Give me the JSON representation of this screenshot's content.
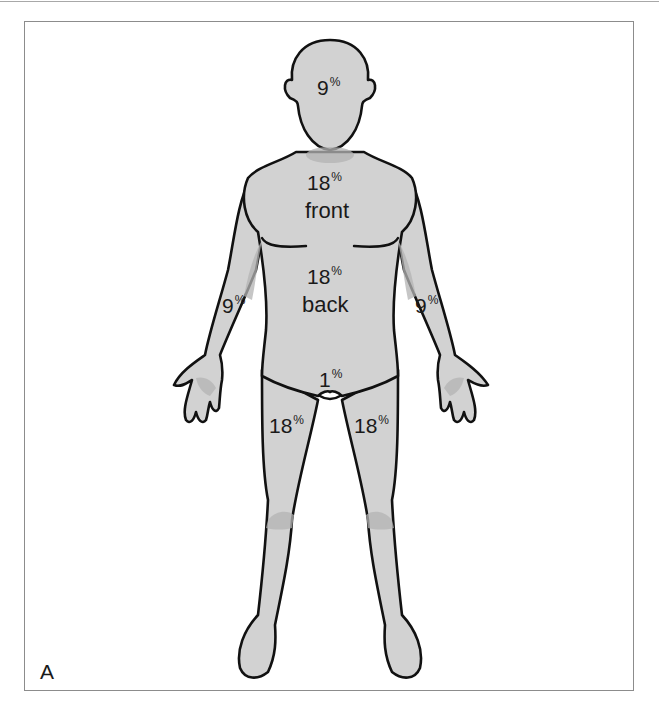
{
  "figure": {
    "panel_label": "A",
    "colors": {
      "skin_fill": "#d2d2d2",
      "shadow": "#b4b4b4",
      "outline": "#111111",
      "frame": "#8c8c8c"
    },
    "regions": [
      {
        "id": "head",
        "value": "9",
        "unit": "%"
      },
      {
        "id": "torso-front",
        "value": "18",
        "unit": "%",
        "caption": "front"
      },
      {
        "id": "torso-back",
        "value": "18",
        "unit": "%",
        "caption": "back"
      },
      {
        "id": "right-arm",
        "value": "9",
        "unit": "%"
      },
      {
        "id": "left-arm",
        "value": "9",
        "unit": "%"
      },
      {
        "id": "perineum",
        "value": "1",
        "unit": "%"
      },
      {
        "id": "right-leg",
        "value": "18",
        "unit": "%"
      },
      {
        "id": "left-leg",
        "value": "18",
        "unit": "%"
      }
    ]
  }
}
